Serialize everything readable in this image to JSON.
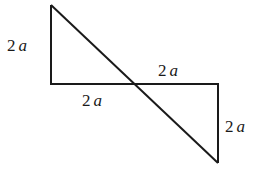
{
  "diagram": {
    "type": "two right triangles sharing a transversal diagonal",
    "stroke_color": "#1a1a1a",
    "labels": {
      "left_vertical": {
        "num": "2",
        "var": "a"
      },
      "top_horizontal_right": {
        "num": "2",
        "var": "a"
      },
      "bottom_horizontal_left": {
        "num": "2",
        "var": "a"
      },
      "right_vertical": {
        "num": "2",
        "var": "a"
      }
    }
  }
}
